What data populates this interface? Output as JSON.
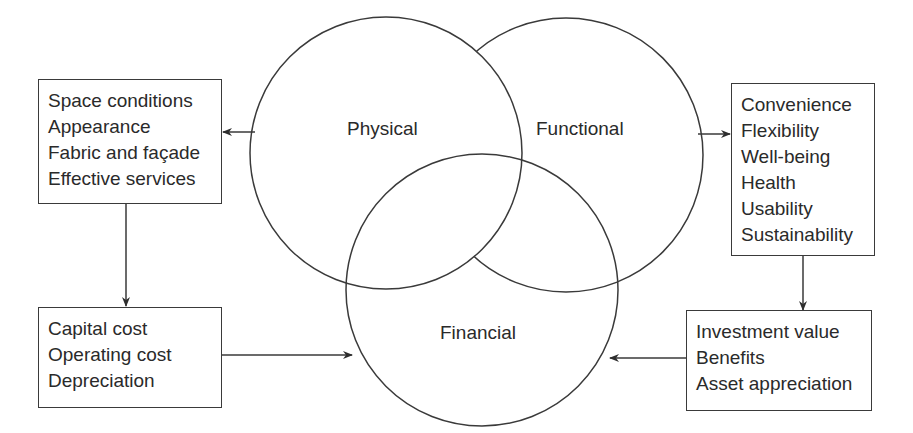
{
  "diagram": {
    "circles": [
      {
        "id": "physical",
        "label": "Physical"
      },
      {
        "id": "functional",
        "label": "Functional"
      },
      {
        "id": "financial",
        "label": "Financial"
      }
    ],
    "boxes": {
      "physical_attributes": {
        "items": [
          "Space conditions",
          "Appearance",
          "Fabric and façade",
          "Effective services"
        ]
      },
      "functional_attributes": {
        "items": [
          "Convenience",
          "Flexibility",
          "Well-being",
          "Health",
          "Usability",
          "Sustainability"
        ]
      },
      "costs": {
        "items": [
          "Capital cost",
          "Operating cost",
          "Depreciation"
        ]
      },
      "value": {
        "items": [
          "Investment value",
          "Benefits",
          "Asset appreciation"
        ]
      }
    },
    "arrows": [
      {
        "from": "physical",
        "to": "physical_attributes"
      },
      {
        "from": "physical_attributes",
        "to": "costs"
      },
      {
        "from": "costs",
        "to": "financial"
      },
      {
        "from": "functional",
        "to": "functional_attributes"
      },
      {
        "from": "functional_attributes",
        "to": "value"
      },
      {
        "from": "value",
        "to": "financial"
      }
    ],
    "colors": {
      "line": "#3a3a3a",
      "text": "#2a2a2a",
      "background": "#ffffff"
    }
  }
}
